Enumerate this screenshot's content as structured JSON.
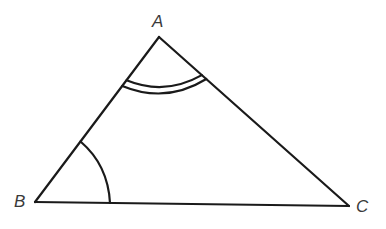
{
  "diagram": {
    "type": "triangle",
    "vertices": {
      "A": {
        "label": "A",
        "x": 159,
        "y": 37
      },
      "B": {
        "label": "B",
        "x": 35,
        "y": 202
      },
      "C": {
        "label": "C",
        "x": 349,
        "y": 206
      }
    },
    "sides": [
      "AB",
      "BC",
      "CA"
    ],
    "angle_marks": [
      {
        "vertex": "A",
        "arcs": 2,
        "description": "double arc"
      },
      {
        "vertex": "B",
        "arcs": 1,
        "description": "single arc"
      }
    ],
    "colors": {
      "stroke": "#1a1a1a",
      "label": "#3a3a3a",
      "background": "#ffffff"
    }
  }
}
